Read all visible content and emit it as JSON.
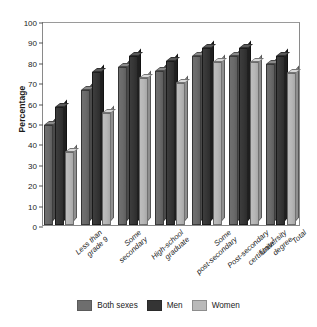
{
  "chart_data": {
    "type": "bar",
    "title": "",
    "subtitle": "",
    "xlabel": "",
    "ylabel": "Percentage",
    "ylim": [
      0,
      100
    ],
    "yticks": [
      0,
      10,
      20,
      30,
      40,
      50,
      60,
      70,
      80,
      90,
      100
    ],
    "grid": false,
    "legend_position": "bottom",
    "categories": [
      "Less than grade 9",
      "Some secondary",
      "High-school graduate",
      "Some post-secondary",
      "Post-secondary certificate¹",
      "University degree",
      "Total"
    ],
    "category_lines": [
      [
        "Less than",
        "grade 9"
      ],
      [
        "Some",
        "secondary"
      ],
      [
        "High-school",
        "graduate"
      ],
      [
        "Some",
        "post-secondary"
      ],
      [
        "Post-secondary",
        "certificate¹"
      ],
      [
        "University",
        "degree"
      ],
      [
        "Total"
      ]
    ],
    "series": [
      {
        "name": "Both sexes",
        "color": "#6e6e6e",
        "values": [
          49,
          66,
          77.5,
          75.5,
          83,
          83,
          79
        ]
      },
      {
        "name": "Men",
        "color": "#343434",
        "values": [
          58,
          75,
          83,
          80.5,
          87,
          87,
          83
        ]
      },
      {
        "name": "Women",
        "color": "#b9b9b9",
        "values": [
          36,
          55,
          72,
          69.5,
          80,
          80,
          74.5
        ]
      }
    ]
  },
  "axis": {
    "y_title": "Percentage",
    "y_ticks": [
      "100",
      "90",
      "80",
      "70",
      "60",
      "50",
      "40",
      "30",
      "20",
      "10",
      "0"
    ]
  },
  "legend": {
    "items": [
      {
        "label": "Both sexes",
        "swatch": "both-sexes-swatch"
      },
      {
        "label": "Men",
        "swatch": "men-swatch"
      },
      {
        "label": "Women",
        "swatch": "women-swatch"
      }
    ]
  }
}
